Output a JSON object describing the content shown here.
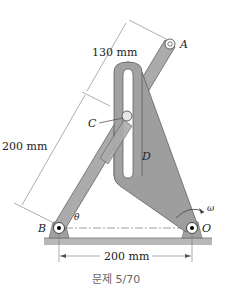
{
  "figure": {
    "caption": "문제 5/70",
    "labels": {
      "A": "A",
      "B": "B",
      "C": "C",
      "D": "D",
      "O": "O",
      "theta": "θ",
      "omega": "ω"
    },
    "dimensions": {
      "upper_arm": "130 mm",
      "lower_arm": "200 mm",
      "base": "200 mm"
    },
    "colors": {
      "link_fill": "#a9a9a9",
      "plate_fill": "#9c9c9c",
      "slot_fill": "#ffffff",
      "ground_fill": "#b5b5b5",
      "line": "#555555"
    }
  }
}
